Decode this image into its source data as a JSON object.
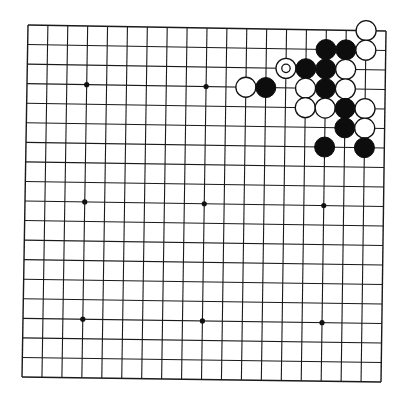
{
  "board": {
    "size": 19,
    "corners": {
      "top_left": [
        28,
        25
      ],
      "top_right": [
        386,
        31
      ],
      "bottom_left": [
        22,
        377
      ],
      "bottom_right": [
        381,
        382
      ]
    },
    "line_color": "#1a1a1a",
    "background": "#ffffff",
    "star_points": [
      [
        3,
        3
      ],
      [
        9,
        3
      ],
      [
        3,
        9
      ],
      [
        9,
        9
      ],
      [
        15,
        9
      ],
      [
        3,
        15
      ],
      [
        9,
        15
      ],
      [
        15,
        15
      ],
      [
        15,
        3
      ]
    ],
    "stone_radius": 10
  },
  "stones": [
    {
      "color": "white",
      "col": 17,
      "row": 0
    },
    {
      "color": "black",
      "col": 15,
      "row": 1
    },
    {
      "color": "black",
      "col": 16,
      "row": 1
    },
    {
      "color": "white",
      "col": 17,
      "row": 1
    },
    {
      "color": "white",
      "col": 13,
      "row": 2,
      "marked": true
    },
    {
      "color": "black",
      "col": 14,
      "row": 2
    },
    {
      "color": "black",
      "col": 15,
      "row": 2
    },
    {
      "color": "white",
      "col": 16,
      "row": 2
    },
    {
      "color": "white",
      "col": 11,
      "row": 3
    },
    {
      "color": "black",
      "col": 12,
      "row": 3
    },
    {
      "color": "white",
      "col": 14,
      "row": 3
    },
    {
      "color": "black",
      "col": 15,
      "row": 3
    },
    {
      "color": "white",
      "col": 16,
      "row": 3
    },
    {
      "color": "white",
      "col": 14,
      "row": 4
    },
    {
      "color": "white",
      "col": 15,
      "row": 4
    },
    {
      "color": "black",
      "col": 16,
      "row": 4
    },
    {
      "color": "white",
      "col": 17,
      "row": 4
    },
    {
      "color": "black",
      "col": 16,
      "row": 5
    },
    {
      "color": "white",
      "col": 17,
      "row": 5
    },
    {
      "color": "black",
      "col": 15,
      "row": 6
    },
    {
      "color": "black",
      "col": 17,
      "row": 6
    }
  ],
  "last_move_marker": {
    "col": 13,
    "row": 2,
    "shape": "circle"
  },
  "caption": "Go board position, upper-right corner fight"
}
